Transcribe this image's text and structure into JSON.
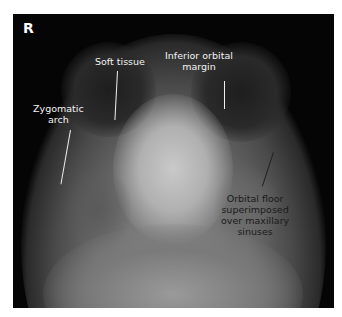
{
  "figure": {
    "type": "radiograph",
    "view": "occipitomental facial bones",
    "side_marker": "R",
    "labels": [
      {
        "id": "soft-tissue",
        "text": "Soft tissue"
      },
      {
        "id": "inferior-orbital-margin",
        "line1": "Inferior orbital",
        "line2": "margin"
      },
      {
        "id": "zygomatic-arch",
        "line1": "Zygomatic",
        "line2": "arch"
      },
      {
        "id": "orbital-floor",
        "line1": "Orbital floor",
        "line2": "superimposed",
        "line3": "over maxillary",
        "line4": "sinuses"
      }
    ]
  }
}
